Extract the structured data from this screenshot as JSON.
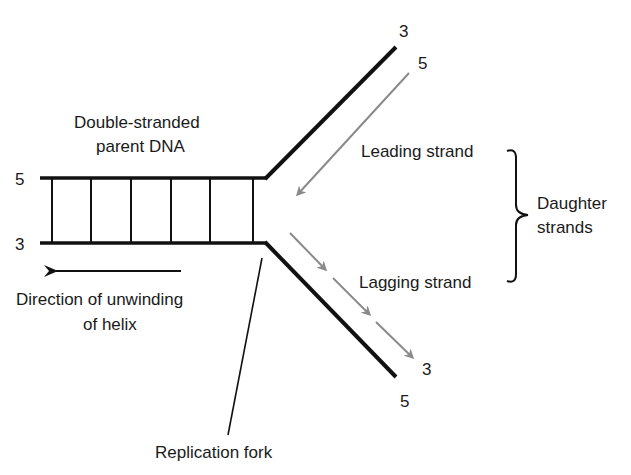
{
  "diagram": {
    "labels": {
      "parent_line1": "Double-stranded",
      "parent_line2": "parent DNA",
      "leading": "Leading strand",
      "lagging": "Lagging strand",
      "daughter_line1": "Daughter",
      "daughter_line2": "strands",
      "direction_line1": "Direction of unwinding",
      "direction_line2": "of helix",
      "fork": "Replication fork"
    },
    "ends": {
      "parent_top_left": "5",
      "parent_bottom_left": "3",
      "upper_arm_template": "3",
      "upper_arm_leading": "5",
      "lower_arm_lagging": "3",
      "lower_arm_template": "5"
    },
    "colors": {
      "strand": "#111111",
      "daughter_strand": "#8a8a8a",
      "text": "#1a1a1a"
    },
    "rungs_count": 6
  }
}
